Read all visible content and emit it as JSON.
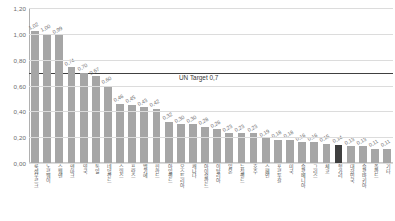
{
  "chart_data": {
    "type": "bar",
    "title": "",
    "xlabel": "",
    "ylabel": "",
    "ylim": [
      0,
      1.2
    ],
    "yticks": [
      "0,00",
      "0,20",
      "0,40",
      "0,60",
      "0,80",
      "1,00",
      "1,20"
    ],
    "ytick_values": [
      0.0,
      0.2,
      0.4,
      0.6,
      0.8,
      1.0,
      1.2
    ],
    "grid": true,
    "legend": "none",
    "categories": [
      "룩셈부르크",
      "노르웨이",
      "스웨덴",
      "덴마크",
      "영국",
      "독일",
      "네덜란드",
      "스위스",
      "프랑스",
      "벨기에",
      "핀란드",
      "아일랜드",
      "오스트리아",
      "캐나다",
      "아이슬란드",
      "이탈리아",
      "일본",
      "뉴질랜드",
      "호주",
      "스페인",
      "포르투갈",
      "미국",
      "슬로베니아",
      "그리스",
      "체코",
      "헝가리",
      "대한민국",
      "슬로바키아",
      "폴란드",
      "기타"
    ],
    "values": [
      1.02,
      1.0,
      0.99,
      0.74,
      0.7,
      0.67,
      0.6,
      0.46,
      0.45,
      0.43,
      0.42,
      0.32,
      0.3,
      0.3,
      0.28,
      0.26,
      0.23,
      0.23,
      0.23,
      0.19,
      0.18,
      0.18,
      0.16,
      0.16,
      0.15,
      0.14,
      0.13,
      0.13,
      0.11,
      0.11
    ],
    "value_labels": [
      "1,02",
      "1,00",
      "0,99",
      "0,74",
      "0,70",
      "0,67",
      "0,60",
      "0,46",
      "0,45",
      "0,43",
      "0,42",
      "0,32",
      "0,30",
      "0,30",
      "0,28",
      "0,26",
      "0,23",
      "0,23",
      "0,23",
      "0,19",
      "0,18",
      "0,18",
      "0,16",
      "0,16",
      "0,15",
      "0,14",
      "0,13",
      "0,13",
      "0,11",
      "0,11"
    ],
    "highlight_index": 25,
    "bar_color": "#a6a6a6",
    "highlight_color": "#3f3f3f",
    "reference_line": {
      "label": "UN Target 0,7",
      "value": 0.7,
      "color": "#404040"
    }
  }
}
